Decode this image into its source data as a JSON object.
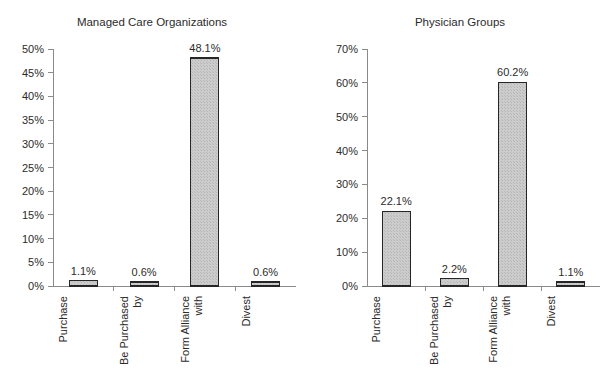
{
  "page": {
    "background_color": "#ffffff",
    "bar_fill_color": "#c8c8c8",
    "bar_border_color": "#262626",
    "axis_color": "#8a8a8a",
    "text_color": "#2b2b2b"
  },
  "chart_data": [
    {
      "type": "bar",
      "title": "Managed Care Organizations",
      "xlabel": "",
      "ylabel": "",
      "ylim": [
        0,
        50
      ],
      "ytick_step": 5,
      "ytick_labels": [
        "0%",
        "5%",
        "10%",
        "15%",
        "20%",
        "25%",
        "30%",
        "35%",
        "40%",
        "45%",
        "50%"
      ],
      "ytick_values": [
        0,
        5,
        10,
        15,
        20,
        25,
        30,
        35,
        40,
        45,
        50
      ],
      "grid": false,
      "legend": "none",
      "categories": [
        "Purchase",
        "Be Purchased by",
        "Form Alliance with",
        "Divest"
      ],
      "category_lines": [
        [
          "Purchase"
        ],
        [
          "Be Purchased",
          "by"
        ],
        [
          "Form Alliance",
          "with"
        ],
        [
          "Divest"
        ]
      ],
      "values": [
        1.1,
        0.6,
        48.1,
        0.6
      ],
      "value_labels": [
        "1.1%",
        "0.6%",
        "48.1%",
        "0.6%"
      ]
    },
    {
      "type": "bar",
      "title": "Physician Groups",
      "xlabel": "",
      "ylabel": "",
      "ylim": [
        0,
        70
      ],
      "ytick_step": 10,
      "ytick_labels": [
        "0%",
        "10%",
        "20%",
        "30%",
        "40%",
        "50%",
        "60%",
        "70%"
      ],
      "ytick_values": [
        0,
        10,
        20,
        30,
        40,
        50,
        60,
        70
      ],
      "grid": false,
      "legend": "none",
      "categories": [
        "Purchase",
        "Be Purchased by",
        "Form Alliance with",
        "Divest"
      ],
      "category_lines": [
        [
          "Purchase"
        ],
        [
          "Be Purchased",
          "by"
        ],
        [
          "Form Alliance",
          "with"
        ],
        [
          "Divest"
        ]
      ],
      "values": [
        22.1,
        2.2,
        60.2,
        1.1
      ],
      "value_labels": [
        "22.1%",
        "2.2%",
        "60.2%",
        "1.1%"
      ]
    }
  ]
}
